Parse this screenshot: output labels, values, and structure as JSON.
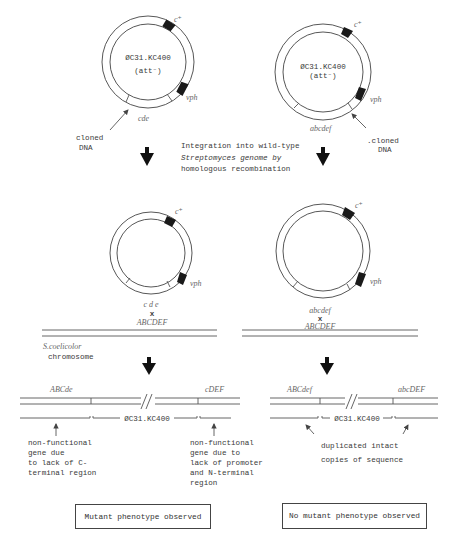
{
  "plasmids_top": {
    "left": {
      "name": "ØC31.KC400",
      "subtitle": "(att⁻)",
      "marker_top": "c⁺",
      "marker_right": "vph",
      "insert_label": "cde",
      "callout": [
        "cloned",
        "DNA"
      ]
    },
    "right": {
      "name": "ØC31.KC400",
      "subtitle": "(att⁻)",
      "marker_top": "c⁺",
      "marker_right": "vph",
      "insert_label": "abcdef",
      "callout": [
        ".cloned",
        "DNA"
      ]
    }
  },
  "step_caption": [
    "Integration into wild-type",
    "Streptomyces genome by",
    "homologous recombination"
  ],
  "plasmids_mid": {
    "left": {
      "marker_top": "c⁺",
      "marker_right": "vph",
      "insert_label": "cde",
      "cross": "x",
      "target": "ABCDEF"
    },
    "right": {
      "marker_top": "c⁺",
      "marker_right": "vph",
      "insert_label": "abcdef",
      "cross": "x",
      "target": "ABCDEF"
    }
  },
  "chromosome_label": [
    "S.coelicolor",
    "chromosome"
  ],
  "results": {
    "left": {
      "left_gene": "ABCde",
      "right_gene": "cDEF",
      "phage_label": "ØC31.KC400",
      "note_left": [
        "non-functional",
        "gene due",
        "to lack of C-",
        "terminal region"
      ],
      "note_right": [
        "non-functional",
        "gene due to",
        "lack of promoter",
        "and N-terminal",
        "region"
      ],
      "outcome": "Mutant phenotype observed"
    },
    "right": {
      "left_gene": "ABCdef",
      "right_gene": "abcDEF",
      "phage_label": "ØC31.KC400",
      "note": [
        "duplicated intact",
        "copies of sequence"
      ],
      "outcome": "No mutant phenotype observed"
    }
  }
}
